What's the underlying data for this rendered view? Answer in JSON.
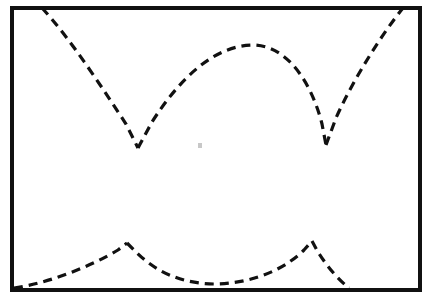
{
  "figure": {
    "background_color": "#ffffff",
    "stroke_color": "#111111",
    "canvas": {
      "width": 434,
      "height": 301
    },
    "frame": {
      "name": "plot-border",
      "x": 12,
      "y": 8,
      "width": 408,
      "height": 282,
      "stroke_width": 4,
      "fill": "#ffffff"
    },
    "style": {
      "curve_stroke_width": 3.2,
      "dash_length": 9,
      "dash_gap": 6,
      "dash_array": "9 6"
    },
    "curves": [
      {
        "name": "upper-left-descending-branch",
        "label": "Left descending arc to first cusp",
        "start": [
          42,
          8
        ],
        "end": [
          138,
          148
        ],
        "path": "M 42 8 C 70 38 105 92 126 124 L 138 148"
      },
      {
        "name": "upper-middle-arch",
        "label": "Central arch between the two cusps",
        "start": [
          138,
          148
        ],
        "peak": [
          250,
          45
        ],
        "end": [
          326,
          145
        ],
        "path": "M 138 148 L 152 122 C 180 78 214 46 252 45 C 292 45 314 92 322 124 L 326 145"
      },
      {
        "name": "upper-right-ascending-branch",
        "label": "Right ascending arc from second cusp",
        "start": [
          326,
          145
        ],
        "end": [
          403,
          8
        ],
        "path": "M 326 145 L 336 118 C 354 78 382 34 403 8"
      },
      {
        "name": "lower-left-rising-branch",
        "label": "Lower-left rising arc from bottom-left corner to first lower peak",
        "start": [
          14,
          288
        ],
        "peak": [
          127,
          243
        ],
        "end": [
          127,
          243
        ],
        "path": "M 14 288 C 46 284 92 266 118 250 L 127 243"
      },
      {
        "name": "lower-middle-valley",
        "label": "Lower central valley between the two lower peaks",
        "start": [
          127,
          243
        ],
        "minimum": [
          215,
          284
        ],
        "end": [
          312,
          241
        ],
        "path": "M 127 243 L 136 252 C 160 276 188 284 216 284 C 258 283 288 266 304 250 L 312 241"
      },
      {
        "name": "lower-right-descending-branch",
        "label": "Lower-right descending arc to the bottom border",
        "start": [
          312,
          241
        ],
        "end": [
          349,
          288
        ],
        "path": "M 312 241 L 318 252 C 328 268 340 281 349 288"
      }
    ],
    "artifacts": [
      {
        "name": "scan-speckle",
        "x": 198,
        "y": 143,
        "width": 4,
        "height": 5
      }
    ]
  }
}
